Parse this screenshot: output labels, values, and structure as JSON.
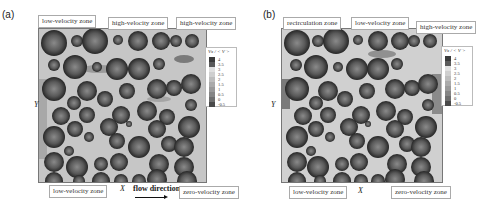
{
  "figure": {
    "panels": [
      {
        "id": "a",
        "letter": "(a)",
        "zone_labels": {
          "top_left": "low-velocity zone",
          "top_mid": "high-velocity zone",
          "top_right": "high-velocity zone",
          "bottom_left": "low-velocity zone",
          "bottom_right": "zero-velocity zone"
        },
        "x_axis_label": "X",
        "y_axis_label": "Y",
        "flow_label": "flow direction",
        "legend": {
          "title": "Vx / < V >",
          "ticks": [
            "4",
            "3.5",
            "3",
            "2.5",
            "2",
            "1.5",
            "1",
            "0.5",
            "0",
            "-0.5"
          ]
        }
      },
      {
        "id": "b",
        "letter": "(b)",
        "zone_labels": {
          "top_left": "recirculation zone",
          "top_mid": "low-velocity zone",
          "top_right": "high-velocity zone",
          "bottom_left": "low-velocity zone",
          "bottom_right": "zero-velocity zone"
        },
        "x_axis_label": "X",
        "y_axis_label": "Y",
        "legend": {
          "title": "Vx / < V >",
          "ticks": [
            "4",
            "3.5",
            "3",
            "2.5",
            "2",
            "1.5",
            "1",
            "0.5",
            "0",
            "-0.5"
          ]
        }
      }
    ],
    "colors": {
      "field_background": "#c8c8c8",
      "sphere_dark": "#2e2e2e",
      "sphere_mid": "#6a6a6a",
      "legend_scale": [
        "#3a3a3a",
        "#5a5a5a",
        "#e0e0e0",
        "#cfcfcf",
        "#bdbdbd",
        "#aaaaaa",
        "#999999",
        "#858585",
        "#6e6e6e",
        "#4a4a4a"
      ]
    }
  }
}
